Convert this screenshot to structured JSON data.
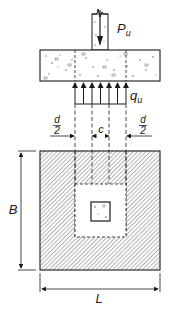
{
  "diagram": {
    "type": "footing-punching-shear",
    "colors": {
      "line": "#1a1a1a",
      "hatch": "#555555",
      "background": "#ffffff"
    },
    "elevation": {
      "load_label": "P",
      "load_subscript": "u",
      "pressure_label": "q",
      "pressure_subscript": "u"
    },
    "dimensions": {
      "left_offset_num": "d",
      "left_offset_den": "2",
      "column_width": "c",
      "right_offset_num": "d",
      "right_offset_den": "2",
      "width_label": "B",
      "length_label": "L"
    }
  }
}
